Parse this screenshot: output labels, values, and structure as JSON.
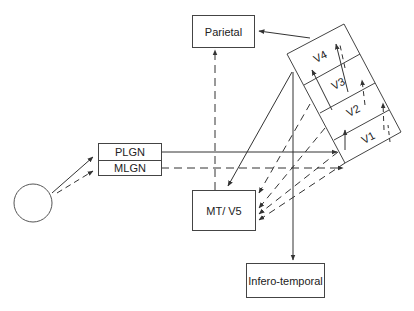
{
  "diagram": {
    "nodes": {
      "retina": {
        "shape": "circle"
      },
      "plgn": {
        "label": "PLGN"
      },
      "mlgn": {
        "label": "MLGN"
      },
      "parietal": {
        "label": "Parietal"
      },
      "mt_v5": {
        "label": "MT/ V5"
      },
      "infero_temporal": {
        "label": "Infero-temporal"
      },
      "visual_cortex": {
        "areas": [
          {
            "label": "V4"
          },
          {
            "label": "V3"
          },
          {
            "label": "V2"
          },
          {
            "label": "V1"
          }
        ]
      }
    },
    "edges": [
      {
        "from": "retina",
        "to": "plgn",
        "style": "solid"
      },
      {
        "from": "retina",
        "to": "mlgn",
        "style": "dashed"
      },
      {
        "from": "plgn",
        "to": "V1",
        "style": "solid"
      },
      {
        "from": "mlgn",
        "to": "V1",
        "style": "dashed"
      },
      {
        "from": "V4",
        "to": "parietal",
        "style": "solid"
      },
      {
        "from": "visual_cortex",
        "to": "mt_v5",
        "style": "solid"
      },
      {
        "from": "visual_cortex",
        "to": "infero_temporal",
        "style": "solid"
      },
      {
        "from": "V1/V2/V3",
        "to": "mt_v5",
        "style": "dashed"
      },
      {
        "from": "mt_v5",
        "to": "parietal",
        "style": "dashed"
      },
      {
        "from": "V1",
        "to": "V2",
        "style": "solid"
      },
      {
        "from": "V2",
        "to": "V3",
        "style": "solid"
      },
      {
        "from": "V3",
        "to": "V4",
        "style": "solid"
      }
    ],
    "colors": {
      "stroke": "#444444",
      "background": "#ffffff",
      "text": "#222222"
    }
  }
}
